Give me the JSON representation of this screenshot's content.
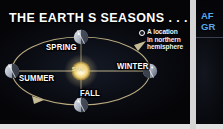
{
  "figure": {
    "type": "diagram",
    "title": "THE  EARTH S SEASONS . . ."
  },
  "left_panel": {
    "title": "THE  EARTH S SEASONS . . .",
    "sun_label": "SUN",
    "legend": {
      "marker_icon": "open-circle-marker-icon",
      "line1": "A location",
      "line2": "in northern",
      "line3": "hemisphere"
    },
    "season_labels": [
      {
        "name": "spring",
        "label": "SPRING",
        "orbit_position": "top"
      },
      {
        "name": "winter",
        "label": "WINTER",
        "orbit_position": "right"
      },
      {
        "name": "summer",
        "label": "SUMMER",
        "orbit_position": "left"
      },
      {
        "name": "fall",
        "label": "FALL",
        "orbit_position": "bottom"
      }
    ],
    "earth_positions": [
      {
        "season": "spring",
        "cx": 81,
        "cy": 37
      },
      {
        "season": "winter",
        "cx": 150,
        "cy": 71
      },
      {
        "season": "summer",
        "cx": 12,
        "cy": 71
      },
      {
        "season": "fall",
        "cx": 81,
        "cy": 105
      }
    ],
    "orbit": {
      "center_x": 81,
      "center_y": 71,
      "radius_x": 69,
      "radius_y": 34,
      "direction": "counterclockwise",
      "arrow_count": 2
    },
    "colors": {
      "background": "#07070c",
      "orbit_line": "#c9b98a",
      "title_text": "#ffffff",
      "label_text": "#ffffff",
      "sun": "#fff3c4",
      "earth_lit": "#cfd4dd",
      "earth_dark": "#2a2f3a"
    }
  },
  "right_panel": {
    "heading_line1": "AF",
    "heading_line2": "GR",
    "cropped": "true",
    "heading_color": "#5aa8e8"
  }
}
